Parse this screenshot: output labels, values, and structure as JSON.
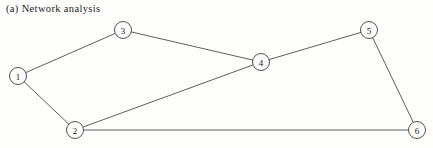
{
  "figure": {
    "caption": "(a) Network analysis",
    "width": 433,
    "height": 148,
    "background_color": "#fdfdfc"
  },
  "chart_data": {
    "type": "diagram",
    "subtype": "node-link-network-graph",
    "title": "(a) Network analysis",
    "xlabel": "",
    "ylabel": "",
    "grid": false,
    "legend": false,
    "directed": false,
    "weighted": false,
    "node_radius": 8.5,
    "node_count": 6,
    "edge_count": 7,
    "edge_color": "#4d4d4d",
    "node_stroke_color": "#3f3f3f",
    "node_fill_color": "#fdfdfc",
    "label_color": "#202020",
    "nodes": [
      {
        "id": "1",
        "label": "1",
        "x": 18,
        "y": 76
      },
      {
        "id": "2",
        "label": "2",
        "x": 75,
        "y": 130
      },
      {
        "id": "3",
        "label": "3",
        "x": 123,
        "y": 30
      },
      {
        "id": "4",
        "label": "4",
        "x": 261,
        "y": 62
      },
      {
        "id": "5",
        "label": "5",
        "x": 369,
        "y": 30
      },
      {
        "id": "6",
        "label": "6",
        "x": 417,
        "y": 130
      }
    ],
    "edges": [
      {
        "source": "1",
        "target": "3"
      },
      {
        "source": "1",
        "target": "2"
      },
      {
        "source": "3",
        "target": "4"
      },
      {
        "source": "2",
        "target": "4"
      },
      {
        "source": "2",
        "target": "6"
      },
      {
        "source": "4",
        "target": "5"
      },
      {
        "source": "5",
        "target": "6"
      }
    ]
  }
}
